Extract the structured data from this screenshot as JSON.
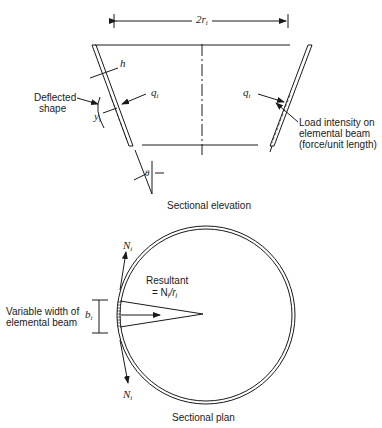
{
  "figure": {
    "elevation": {
      "caption": "Sectional elevation",
      "dimension_label": {
        "main": "2r",
        "sub": "i"
      },
      "thickness_label": "h",
      "deflected_shape_label": [
        "Deflected",
        "shape"
      ],
      "deflection_label": {
        "main": "y",
        "sub": "i"
      },
      "load_left_label": {
        "main": "q",
        "sub": "i"
      },
      "load_right_label": {
        "main": "q",
        "sub": "i"
      },
      "load_description": [
        "Load intensity on",
        "elemental beam",
        "(force/unit length)"
      ],
      "angle_label": "θ"
    },
    "plan": {
      "caption": "Sectional plan",
      "force_top_label": {
        "main": "N",
        "sub": "i"
      },
      "force_bottom_label": {
        "main": "N",
        "sub": "i"
      },
      "resultant_label": "Resultant",
      "resultant_formula": {
        "prefix": "= N",
        "sub1": "i",
        "mid": "/r",
        "sub2": "i"
      },
      "width_label": {
        "main": "b",
        "sub": "i"
      },
      "width_description": [
        "Variable width of",
        "elemental beam"
      ]
    },
    "colors": {
      "line": "#1a1a1a",
      "background": "#ffffff"
    }
  }
}
